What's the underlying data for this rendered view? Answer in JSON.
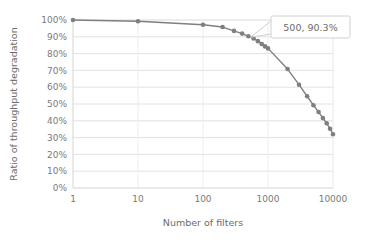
{
  "chart_data": {
    "type": "line",
    "title": "",
    "xlabel": "Number of filters",
    "ylabel": "Ratio of throughput degradation",
    "xscale": "log",
    "xlim": [
      1,
      10000
    ],
    "ylim": [
      0,
      100
    ],
    "grid": "horizontal",
    "legend": "none",
    "xticklabels": [
      "1",
      "10",
      "100",
      "1000",
      "10000"
    ],
    "xtickvalues": [
      1,
      10,
      100,
      1000,
      10000
    ],
    "yticklabels": [
      "0%",
      "10%",
      "20%",
      "30%",
      "40%",
      "50%",
      "60%",
      "70%",
      "80%",
      "90%",
      "100%"
    ],
    "ytickvalues": [
      0,
      10,
      20,
      30,
      40,
      50,
      60,
      70,
      80,
      90,
      100
    ],
    "series": [
      {
        "name": "Ratio of throughput degradation",
        "color": "#7f7f7f",
        "marker": "circle",
        "points": [
          {
            "x": 1,
            "y": 100.0
          },
          {
            "x": 10,
            "y": 99.3
          },
          {
            "x": 100,
            "y": 97.2
          },
          {
            "x": 200,
            "y": 95.8
          },
          {
            "x": 300,
            "y": 93.5
          },
          {
            "x": 400,
            "y": 91.9
          },
          {
            "x": 500,
            "y": 90.3
          },
          {
            "x": 600,
            "y": 89.0
          },
          {
            "x": 700,
            "y": 87.4
          },
          {
            "x": 800,
            "y": 85.7
          },
          {
            "x": 900,
            "y": 84.3
          },
          {
            "x": 1000,
            "y": 83.1
          },
          {
            "x": 2000,
            "y": 70.8
          },
          {
            "x": 3000,
            "y": 61.5
          },
          {
            "x": 4000,
            "y": 54.6
          },
          {
            "x": 5000,
            "y": 49.3
          },
          {
            "x": 6000,
            "y": 45.2
          },
          {
            "x": 7000,
            "y": 41.6
          },
          {
            "x": 8000,
            "y": 38.5
          },
          {
            "x": 9000,
            "y": 35.3
          },
          {
            "x": 10000,
            "y": 32.0
          }
        ]
      }
    ],
    "annotations": [
      {
        "label": "500, 90.3%",
        "target_x": 500,
        "target_y": 90.3
      }
    ]
  },
  "axis": {
    "x_title": "Number of filters",
    "y_title": "Ratio of throughput degradation"
  },
  "callout": {
    "label": "500, 90.3%"
  },
  "ticks": {
    "x": [
      "1",
      "10",
      "100",
      "1000",
      "10000"
    ],
    "y": [
      "100%",
      "90%",
      "80%",
      "70%",
      "60%",
      "50%",
      "40%",
      "30%",
      "20%",
      "10%",
      "0%"
    ]
  },
  "colors": {
    "series": "#7f7f7f",
    "gridline": "#e2e2e2",
    "axisline": "#d4d4d4",
    "text": "#7a7a7a",
    "background": "#ffffff",
    "callout_border": "#d0d0d0"
  }
}
